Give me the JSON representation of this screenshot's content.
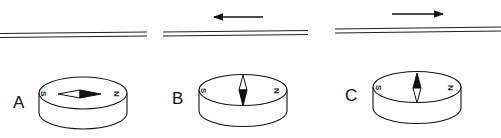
{
  "figure": {
    "colors": {
      "ink": "#111111",
      "background": "#ffffff"
    },
    "panels": [
      {
        "label": "A",
        "current_arrow": "none",
        "compass": {
          "south_label": "S",
          "north_label": "N",
          "needle_orientation": "horizontal",
          "black_tip": "right"
        }
      },
      {
        "label": "B",
        "current_arrow": "left",
        "compass": {
          "south_label": "S",
          "north_label": "N",
          "needle_orientation": "vertical",
          "black_tip": "down"
        }
      },
      {
        "label": "C",
        "current_arrow": "right",
        "compass": {
          "south_label": "S",
          "north_label": "N",
          "needle_orientation": "vertical",
          "black_tip": "up"
        }
      }
    ]
  }
}
